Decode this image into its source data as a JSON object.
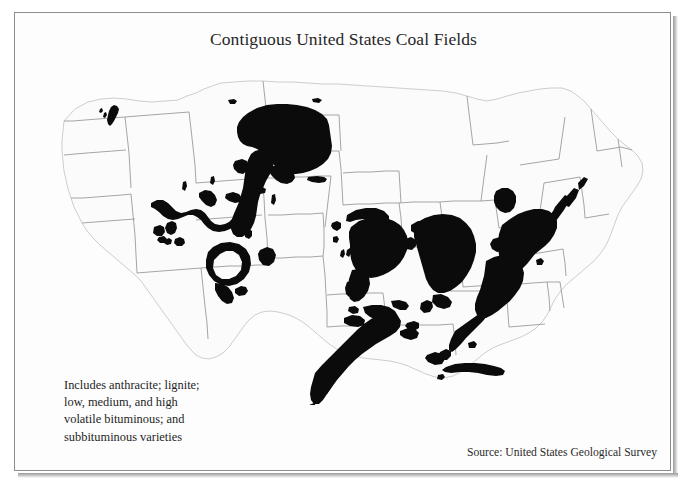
{
  "document": {
    "title": "Contiguous United States Coal Fields",
    "source": "Source: United States Geological Survey"
  },
  "legend": {
    "line1": "Includes anthracite; lignite;",
    "line2": "low, medium, and high",
    "line3": "volatile bituminous; and",
    "line4": "subbituminous varieties"
  },
  "colors": {
    "coal_fill": "#0b0b0b",
    "state_fill": "#fbfbfb",
    "state_border": "#b9b9b9",
    "country_outline": "#9b9b9b",
    "frame_border": "#8d8d8d",
    "page_background": "#ffffff",
    "text": "#1d1d1d"
  },
  "map": {
    "name": "contiguous-united-states-coal-fields-map",
    "projection_note": "Contiguous 48 states, state boundaries shown",
    "coal_regions": [
      {
        "name": "fort-union-lignite-north-dakota-montana",
        "type": "lignite"
      },
      {
        "name": "powder-river-basin-wyoming-montana",
        "type": "subbituminous"
      },
      {
        "name": "green-river-hams-fork-wyoming",
        "type": "subbituminous"
      },
      {
        "name": "uinta-basin-utah-colorado",
        "type": "bituminous"
      },
      {
        "name": "san-juan-basin-new-mexico-colorado",
        "type": "bituminous"
      },
      {
        "name": "raton-mesa-colorado-new-mexico",
        "type": "bituminous"
      },
      {
        "name": "denver-basin-colorado",
        "type": "subbituminous"
      },
      {
        "name": "black-mesa-arizona",
        "type": "bituminous"
      },
      {
        "name": "western-interior-basin-missouri-kansas-oklahoma",
        "type": "bituminous"
      },
      {
        "name": "arkoma-basin-arkansas-oklahoma",
        "type": "bituminous"
      },
      {
        "name": "gulf-coast-lignite-texas-louisiana",
        "type": "lignite"
      },
      {
        "name": "illinois-basin-illinois-indiana-kentucky",
        "type": "bituminous"
      },
      {
        "name": "michigan-basin",
        "type": "bituminous"
      },
      {
        "name": "appalachian-basin-pennsylvania-west-virginia-kentucky",
        "type": "bituminous"
      },
      {
        "name": "pennsylvania-anthracite",
        "type": "anthracite"
      },
      {
        "name": "warrior-basin-alabama",
        "type": "bituminous"
      },
      {
        "name": "washington-state-fields",
        "type": "subbituminous"
      }
    ]
  }
}
